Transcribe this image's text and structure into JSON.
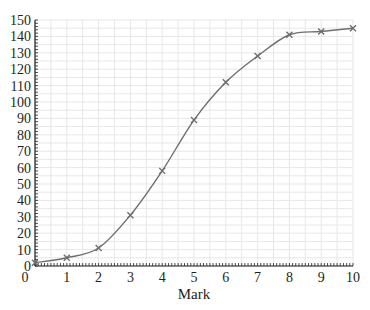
{
  "chart_data": {
    "type": "line",
    "title": "",
    "xlabel": "Mark",
    "ylabel": "",
    "x": [
      0,
      1,
      2,
      3,
      4,
      5,
      6,
      7,
      8,
      9,
      10
    ],
    "series": [
      {
        "name": "Cumulative frequency",
        "values": [
          2,
          5,
          11,
          31,
          58,
          89,
          112,
          128,
          141,
          143,
          145
        ]
      }
    ],
    "xlim": [
      0,
      10
    ],
    "ylim": [
      0,
      150
    ],
    "x_ticks": [
      "0",
      "1",
      "2",
      "3",
      "4",
      "5",
      "6",
      "7",
      "8",
      "9",
      "10"
    ],
    "y_ticks": [
      "0",
      "10",
      "20",
      "30",
      "40",
      "50",
      "60",
      "70",
      "80",
      "90",
      "100",
      "110",
      "120",
      "130",
      "140",
      "150"
    ],
    "grid": true,
    "marker": "x",
    "legend": "none",
    "colors": {
      "line": "#6d6e71",
      "grid": "#e6e7e8",
      "axis": "#231f20"
    }
  }
}
